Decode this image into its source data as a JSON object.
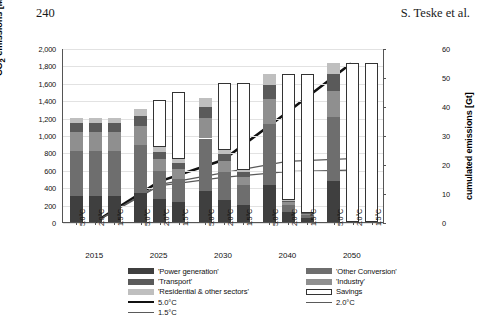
{
  "page": {
    "page_number": "240",
    "running_head": "S. Teske et al."
  },
  "chart_data": {
    "type": "bar",
    "title": "",
    "xlabel": "",
    "ylabel": "CO2 emissions [Mt/yr]",
    "y2label": "cumulated emissions [Gt]",
    "ylim": [
      0,
      2000
    ],
    "y2lim": [
      0,
      60
    ],
    "grid": true,
    "legend_position": "bottom",
    "y_ticks": [
      "0",
      "200",
      "400",
      "600",
      "800",
      "1,000",
      "1,200",
      "1,400",
      "1,600",
      "1,800",
      "2,000"
    ],
    "y2_ticks": [
      "0",
      "10",
      "20",
      "30",
      "40",
      "50",
      "60"
    ],
    "year_groups": [
      "2015",
      "2025",
      "2030",
      "2040",
      "2050"
    ],
    "scenarios": [
      "5.0°C",
      "2.0°C",
      "1.5°C"
    ],
    "stack_order": [
      "Power generation",
      "Other Conversion",
      "Industry",
      "Transport",
      "Residential & other sectors"
    ],
    "stack_colors": [
      "#3f3f3f",
      "#6e6e6e",
      "#8f8f8f",
      "#5a5a5a",
      "#bfbfbf"
    ],
    "savings_color": "#ffffff",
    "bars": [
      {
        "year": "2015",
        "scenario": "5.0°C",
        "segments": [
          300,
          520,
          210,
          105,
          65
        ],
        "total": 1200,
        "savings": 0
      },
      {
        "year": "2015",
        "scenario": "2.0°C",
        "segments": [
          300,
          520,
          210,
          105,
          65
        ],
        "total": 1200,
        "savings": 0
      },
      {
        "year": "2015",
        "scenario": "1.5°C",
        "segments": [
          300,
          520,
          210,
          105,
          65
        ],
        "total": 1200,
        "savings": 0
      },
      {
        "year": "2025",
        "scenario": "5.0°C",
        "segments": [
          330,
          560,
          215,
          115,
          80
        ],
        "total": 1300,
        "savings": 0
      },
      {
        "year": "2025",
        "scenario": "2.0°C",
        "segments": [
          260,
          330,
          140,
          80,
          50
        ],
        "total": 860,
        "savings": 540
      },
      {
        "year": "2025",
        "scenario": "1.5°C",
        "segments": [
          230,
          260,
          120,
          70,
          40
        ],
        "total": 720,
        "savings": 780
      },
      {
        "year": "2030",
        "scenario": "5.0°C",
        "segments": [
          360,
          600,
          230,
          135,
          105
        ],
        "total": 1430,
        "savings": 0
      },
      {
        "year": "2030",
        "scenario": "2.0°C",
        "segments": [
          250,
          320,
          130,
          80,
          50
        ],
        "total": 830,
        "savings": 770
      },
      {
        "year": "2030",
        "scenario": "1.5°C",
        "segments": [
          190,
          230,
          100,
          50,
          30
        ],
        "total": 600,
        "savings": 1000
      },
      {
        "year": "2040",
        "scenario": "5.0°C",
        "segments": [
          430,
          700,
          280,
          170,
          120
        ],
        "total": 1700,
        "savings": 0
      },
      {
        "year": "2040",
        "scenario": "2.0°C",
        "segments": [
          110,
          80,
          40,
          15,
          5
        ],
        "total": 250,
        "savings": 1450
      },
      {
        "year": "2040",
        "scenario": "1.5°C",
        "segments": [
          50,
          30,
          15,
          5,
          0
        ],
        "total": 100,
        "savings": 1600
      },
      {
        "year": "2050",
        "scenario": "5.0°C",
        "segments": [
          470,
          740,
          300,
          190,
          130
        ],
        "total": 1830,
        "savings": 0
      },
      {
        "year": "2050",
        "scenario": "2.0°C",
        "segments": [
          0,
          0,
          0,
          0,
          0
        ],
        "total": 0,
        "savings": 1830
      },
      {
        "year": "2050",
        "scenario": "1.5°C",
        "segments": [
          0,
          0,
          0,
          0,
          0
        ],
        "total": 0,
        "savings": 1830
      }
    ],
    "cumulative_lines": [
      {
        "name": "5.0°C",
        "color": "#111111",
        "width": 2.6,
        "x": [
          "2015",
          "2025",
          "2030",
          "2040",
          "2050"
        ],
        "values": [
          0,
          14,
          21.5,
          38,
          55
        ]
      },
      {
        "name": "2.0°C",
        "color": "#5a5a5a",
        "width": 1.3,
        "x": [
          "2015",
          "2025",
          "2030",
          "2040",
          "2050"
        ],
        "values": [
          0,
          13,
          17,
          21,
          22
        ]
      },
      {
        "name": "1.5°C",
        "color": "#5a5a5a",
        "width": 1.3,
        "x": [
          "2015",
          "2025",
          "2030",
          "2040",
          "2050"
        ],
        "values": [
          0,
          12.5,
          15.5,
          17.5,
          18
        ]
      }
    ]
  },
  "legend": {
    "left_column": [
      {
        "label": "'Power generation'",
        "type": "swatch",
        "color": "#3f3f3f"
      },
      {
        "label": "'Transport'",
        "type": "swatch",
        "color": "#5a5a5a"
      },
      {
        "label": "'Residential & other sectors'",
        "type": "swatch",
        "color": "#bfbfbf"
      },
      {
        "label": "5.0°C",
        "type": "line",
        "color": "#111111"
      },
      {
        "label": "1.5°C",
        "type": "line",
        "color": "#5a5a5a"
      }
    ],
    "right_column": [
      {
        "label": "'Other Conversion'",
        "type": "swatch",
        "color": "#6e6e6e"
      },
      {
        "label": "'Industry'",
        "type": "swatch",
        "color": "#8f8f8f"
      },
      {
        "label": "Savings",
        "type": "box",
        "color": "#ffffff"
      },
      {
        "label": "2.0°C",
        "type": "line",
        "color": "#5a5a5a"
      }
    ]
  }
}
